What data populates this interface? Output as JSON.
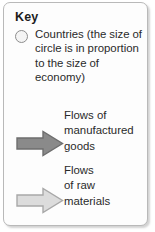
{
  "legend": {
    "title": "Key",
    "background_color": "#fdfdfd",
    "border_color": "#b9b9b9",
    "entries": [
      {
        "symbol": "circle-outline",
        "symbol_fill": "#f4f4f4",
        "symbol_stroke": "#8d8d8d",
        "label": "Countries (the size of circle is in proportion to the size of economy)"
      },
      {
        "symbol": "arrow-right-dark",
        "symbol_fill": "#8a8a8a",
        "symbol_stroke": "#6e6e6e",
        "label_lines": [
          "Flows of",
          "manufactured",
          "goods"
        ]
      },
      {
        "symbol": "arrow-right-light",
        "symbol_fill": "#dcdcdc",
        "symbol_stroke": "#a8a8a8",
        "label_lines": [
          "Flows",
          "of raw",
          "materials"
        ]
      }
    ]
  }
}
